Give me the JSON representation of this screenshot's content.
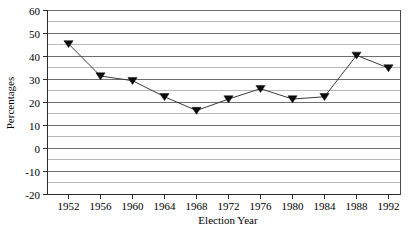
{
  "chart_data": {
    "type": "line",
    "title": "",
    "xlabel": "Election Year",
    "ylabel": "Percentages",
    "categories": [
      1952,
      1956,
      1960,
      1964,
      1968,
      1972,
      1976,
      1980,
      1984,
      1988,
      1992
    ],
    "x_tick_labels": [
      "1952",
      "1956",
      "1960",
      "1964",
      "1968",
      "1972",
      "1976",
      "1980",
      "1984",
      "1988",
      "1992"
    ],
    "values": [
      45.5,
      31.5,
      29.5,
      22.5,
      16.5,
      21.5,
      26.0,
      21.5,
      22.5,
      40.5,
      35.0
    ],
    "y_tick_labels": [
      "60",
      "50",
      "40",
      "30",
      "20",
      "10",
      "0",
      "-10",
      "-20"
    ],
    "y_ticks": [
      60,
      50,
      40,
      30,
      20,
      10,
      0,
      -10,
      -20
    ],
    "y_minor_ticks": [
      55,
      45,
      35,
      25,
      15,
      5,
      -5,
      -15
    ],
    "ylim": [
      -20,
      60
    ],
    "xlim": [
      1950,
      1994
    ],
    "grid": true,
    "grid_axis": "y",
    "legend": false,
    "legend_position": "none",
    "marker": "triangle-down",
    "marker_color": "#0a0a0a",
    "line_color": "#3b3b3b",
    "background_color": "#ffffff"
  },
  "figure": {
    "caption_fragment": ""
  }
}
